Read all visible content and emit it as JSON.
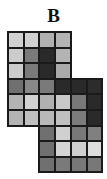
{
  "panel": {
    "label": "B"
  },
  "grid": {
    "origin_x": 7,
    "origin_y": 31,
    "pitch_x": 15.7,
    "pitch_y": 15.6,
    "border_color": "#1a1a1a",
    "rows": [
      {
        "start_col": 0,
        "colors": [
          "#d0d0d0",
          "#d0d0d0",
          "#b0b0b0",
          "#b4b4b4"
        ]
      },
      {
        "start_col": 0,
        "colors": [
          "#cccccc",
          "#7a7a7a",
          "#2a2a2a",
          "#b4b4b4"
        ]
      },
      {
        "start_col": 0,
        "colors": [
          "#cccccc",
          "#7a7a7a",
          "#2a2a2a",
          "#aaaaaa"
        ]
      },
      {
        "start_col": 0,
        "colors": [
          "#707070",
          "#888888",
          "#7a7a7a",
          "#2a2a2a",
          "#2a2a2a",
          "#2c2c2c"
        ]
      },
      {
        "start_col": 0,
        "colors": [
          "#b4b4b4",
          "#d2d2d2",
          "#b0b0b0",
          "#c8c8c8",
          "#787878",
          "#2a2a2a"
        ]
      },
      {
        "start_col": 0,
        "colors": [
          "#b4b4b4",
          "#c0c0c0",
          "#b8b8b8",
          "#c0c0c0",
          "#7c7c7c",
          "#2a2a2a"
        ]
      },
      {
        "start_col": 2,
        "colors": [
          "#707070",
          "#d0d0d0",
          "#787878",
          "#808080"
        ]
      },
      {
        "start_col": 2,
        "colors": [
          "#707070",
          "#d4d4d4",
          "#d0d0d0",
          "#dedede"
        ]
      },
      {
        "start_col": 2,
        "colors": [
          "#707070",
          "#7a7a7a",
          "#787878",
          "#787878"
        ]
      }
    ]
  }
}
